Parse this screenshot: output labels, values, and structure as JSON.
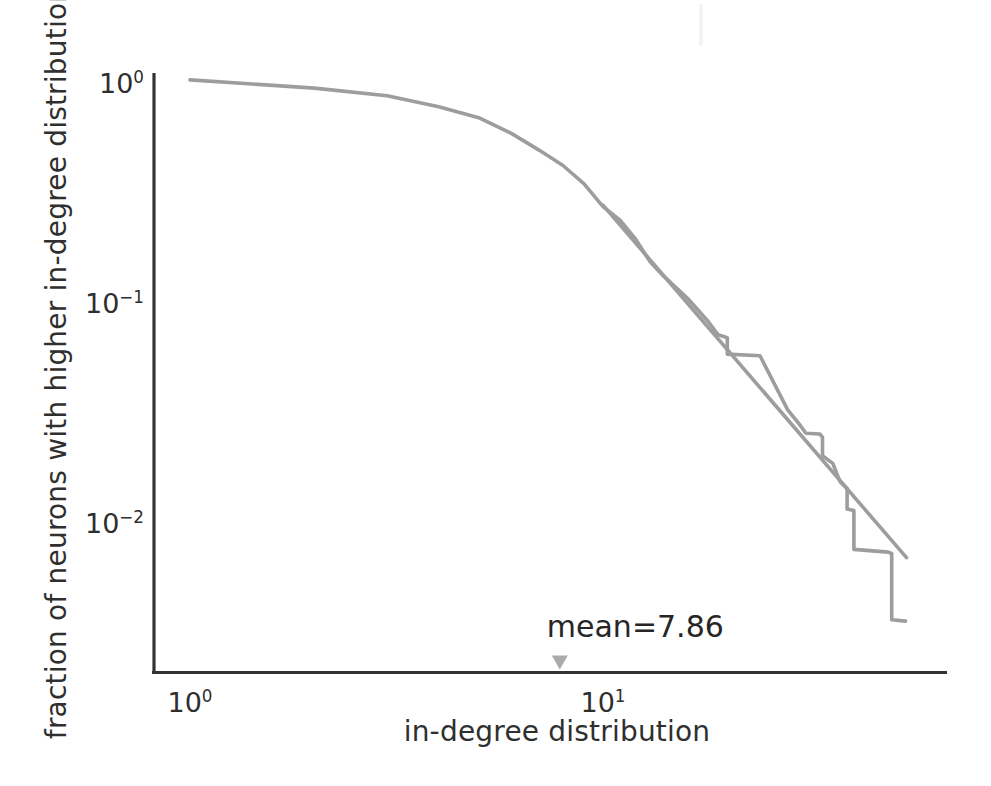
{
  "figure": {
    "background": "#ffffff",
    "axis_color": "#343434",
    "text_color": "#2f2f2f"
  },
  "chart_data": {
    "type": "line",
    "title": "",
    "xlabel": "in-degree distribution",
    "ylabel": "fraction of neurons with higher in-degree distribution",
    "x_scale": "log",
    "y_scale": "log",
    "xlim": [
      0.82,
      68
    ],
    "ylim": [
      0.002,
      1.05
    ],
    "grid": false,
    "legend": "none",
    "x_ticks": [
      {
        "value": 1,
        "base": "10",
        "exp": "0"
      },
      {
        "value": 10,
        "base": "10",
        "exp": "1"
      }
    ],
    "y_ticks": [
      {
        "value": 1,
        "base": "10",
        "exp": "0"
      },
      {
        "value": 0.1,
        "base": "10",
        "exp": "−1"
      },
      {
        "value": 0.01,
        "base": "10",
        "exp": "−2"
      }
    ],
    "series": [
      {
        "name": "empirical-ccdf",
        "color": "#9d9d9d",
        "width": 3.6,
        "points": [
          [
            1,
            0.98
          ],
          [
            2,
            0.9
          ],
          [
            3,
            0.83
          ],
          [
            4,
            0.74
          ],
          [
            5,
            0.66
          ],
          [
            6,
            0.56
          ],
          [
            7,
            0.47
          ],
          [
            8,
            0.4
          ],
          [
            9,
            0.33
          ],
          [
            10,
            0.26
          ],
          [
            11,
            0.226
          ],
          [
            12,
            0.185
          ],
          [
            13,
            0.146
          ],
          [
            14,
            0.126
          ],
          [
            16,
            0.1
          ],
          [
            18,
            0.078
          ],
          [
            19,
            0.068
          ],
          [
            20,
            0.066
          ],
          [
            20,
            0.0556
          ],
          [
            24,
            0.0546
          ],
          [
            28,
            0.031
          ],
          [
            30,
            0.0264
          ],
          [
            31,
            0.0243
          ],
          [
            33.5,
            0.0241
          ],
          [
            34,
            0.0233
          ],
          [
            34,
            0.0192
          ],
          [
            36,
            0.0177
          ],
          [
            37.5,
            0.0146
          ],
          [
            39,
            0.0136
          ],
          [
            39,
            0.011
          ],
          [
            40.5,
            0.0108
          ],
          [
            40.5,
            0.0072
          ],
          [
            49,
            0.007
          ],
          [
            50,
            0.0069
          ],
          [
            50,
            0.00345
          ],
          [
            54,
            0.0034
          ]
        ]
      },
      {
        "name": "power-law-fit",
        "color": "#9d9d9d",
        "width": 3.6,
        "points": [
          [
            10,
            0.264
          ],
          [
            54.3,
            0.0066
          ]
        ]
      }
    ],
    "annotation": {
      "text": "mean=7.86",
      "x": 7.86,
      "marker": "triangle-down",
      "marker_color": "#ababab"
    }
  }
}
